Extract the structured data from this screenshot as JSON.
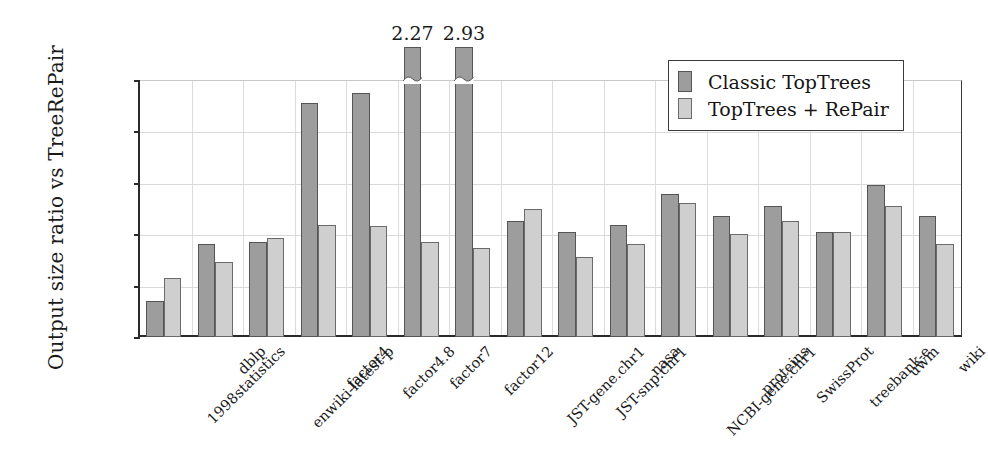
{
  "chart_data": {
    "type": "bar",
    "title": "",
    "xlabel": "",
    "ylabel": "Output size ratio vs TreeRePair",
    "ylim": [
      1,
      2
    ],
    "yticks": [
      "1",
      "1.2",
      "1.4",
      "1.6",
      "1.8",
      "2"
    ],
    "ytick_values": [
      1,
      1.2,
      1.4,
      1.6,
      1.8,
      2
    ],
    "grid": true,
    "legend_position": "top-right",
    "categories": [
      "1998statistics",
      "dblp",
      "enwiki-latest-p",
      "factor4",
      "factor4.8",
      "factor7",
      "factor12",
      "JST-gene.chr1",
      "JST-snp.chr1",
      "nasa",
      "NCBI-gene.chr1",
      "proteins",
      "SwissProt",
      "treebank-e",
      "uwm",
      "wiki"
    ],
    "series": [
      {
        "name": "Classic TopTrees",
        "color": "#9d9d9d",
        "values": [
          1.14,
          1.36,
          1.37,
          1.91,
          1.95,
          2.27,
          2.93,
          1.45,
          1.41,
          1.435,
          1.555,
          1.47,
          1.51,
          1.41,
          1.59,
          1.47
        ]
      },
      {
        "name": "TopTrees + RePair",
        "color": "#cfcfcf",
        "values": [
          1.23,
          1.29,
          1.385,
          1.435,
          1.43,
          1.37,
          1.345,
          1.5,
          1.31,
          1.36,
          1.52,
          1.4,
          1.45,
          1.41,
          1.51,
          1.36
        ]
      }
    ],
    "clipped_labels": [
      {
        "category": "factor7",
        "value": "2.27"
      },
      {
        "category": "factor12",
        "value": "2.93"
      }
    ],
    "annotations": [
      "Bars for factor7 and factor12 exceed the axis maximum and are drawn broken with their values printed above."
    ]
  },
  "legend": {
    "items": [
      {
        "label": "Classic TopTrees",
        "swatch": "dark"
      },
      {
        "label": "TopTrees + RePair",
        "swatch": "light"
      }
    ]
  }
}
